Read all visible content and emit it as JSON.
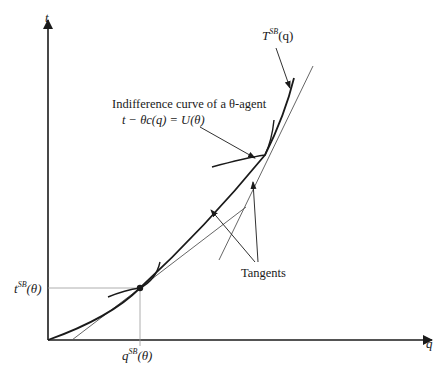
{
  "axes": {
    "y_label": "t",
    "x_label": "q"
  },
  "labels": {
    "t_curve": "T",
    "t_curve_sup": "SB",
    "t_curve_arg": "(q)",
    "ic_line1": "Indifference curve of a θ-agent",
    "ic_line2": "t − θc(q) = U(θ)",
    "tangents": "Tangents",
    "t_tick": "t",
    "t_tick_sup": "SB",
    "t_tick_arg": "(θ)",
    "q_tick": "q",
    "q_tick_sup": "SB",
    "q_tick_arg": "(θ)"
  },
  "colors": {
    "ink": "#1a1a1a",
    "thin": "#555555",
    "guide": "#999999"
  }
}
